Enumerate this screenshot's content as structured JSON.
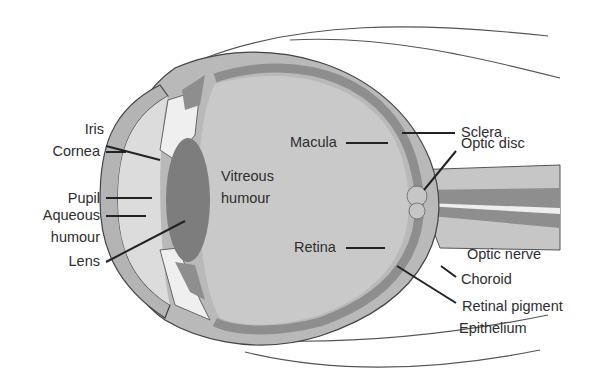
{
  "diagram": {
    "labels": {
      "iris": "Iris",
      "cornea": "Cornea",
      "pupil": "Pupil",
      "aqueous_1": "Aqueous",
      "aqueous_2": "humour",
      "lens": "Lens",
      "vitreous_1": "Vitreous",
      "vitreous_2": "humour",
      "macula": "Macula",
      "retina": "Retina",
      "sclera": "Sclera",
      "optic_disc": "Optic disc",
      "optic_nerve": "Optic nerve",
      "choroid": "Choroid",
      "retinal_pigment": "Retinal pigment",
      "epithelium": "Epithelium"
    },
    "colors": {
      "sclera": "#b9b9b9",
      "choroid": "#8e8e8e",
      "vitreous": "#c9c9c9",
      "lens": "#7d7d7d",
      "aqueous": "#dcdcdc",
      "outline": "#444444",
      "leader": "#222222"
    }
  }
}
